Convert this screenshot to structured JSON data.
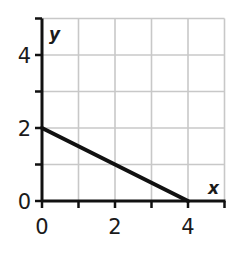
{
  "chart_data": {
    "type": "line",
    "title": "",
    "xlabel": "x",
    "ylabel": "y",
    "xlim": [
      0,
      5
    ],
    "ylim": [
      0,
      5
    ],
    "grid": true,
    "x_ticks": [
      0,
      1,
      2,
      3,
      4,
      5
    ],
    "y_ticks": [
      0,
      1,
      2,
      3,
      4,
      5
    ],
    "x_tick_labels": [
      "0",
      "2",
      "4"
    ],
    "y_tick_labels": [
      "0",
      "2",
      "4"
    ],
    "series": [
      {
        "name": "line",
        "x": [
          0,
          4
        ],
        "y": [
          2,
          0
        ]
      }
    ],
    "colors": {
      "line": "#111111",
      "axis": "#111111",
      "grid": "#c8c8c8"
    }
  }
}
